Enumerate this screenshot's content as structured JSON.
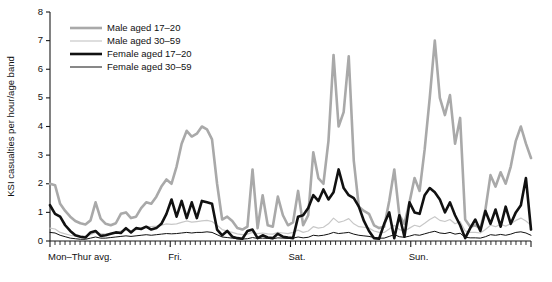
{
  "chart_data": {
    "type": "line",
    "title": "",
    "xlabel": "",
    "ylabel": "KSI casualties per hour/age band",
    "ylim": [
      0,
      8
    ],
    "xlim": [
      0,
      96
    ],
    "yticks": [
      0,
      1,
      2,
      3,
      4,
      5,
      6,
      7,
      8
    ],
    "ytick_labels": [
      "0",
      "1",
      "2",
      "3",
      "4",
      "5",
      "6",
      "7",
      "8"
    ],
    "grid": false,
    "legend_position": "top-left",
    "x_group_labels": [
      "Mon–Thur avg.",
      "Fri.",
      "Sat.",
      "Sun."
    ],
    "x_group_starts": [
      0,
      24,
      48,
      72
    ],
    "hours_per_group": 24,
    "minor_tick_interval_hours": 1,
    "series": [
      {
        "name": "Male aged 17–20",
        "color": "#a9a9a9",
        "width": 2.6,
        "values": [
          2.0,
          1.95,
          1.3,
          1.05,
          0.85,
          0.7,
          0.62,
          0.58,
          0.72,
          1.35,
          0.78,
          0.6,
          0.55,
          0.62,
          0.95,
          1.0,
          0.8,
          0.85,
          1.15,
          1.35,
          1.3,
          1.55,
          1.9,
          2.15,
          2.0,
          2.6,
          3.4,
          3.85,
          3.65,
          3.75,
          4.0,
          3.9,
          3.55,
          2.0,
          0.75,
          0.85,
          0.7,
          0.45,
          0.4,
          0.5,
          2.5,
          0.45,
          1.6,
          0.55,
          0.5,
          1.55,
          0.9,
          0.55,
          0.65,
          1.75,
          0.55,
          0.9,
          3.1,
          2.2,
          2.0,
          3.5,
          6.5,
          4.0,
          4.5,
          6.45,
          2.8,
          1.2,
          1.05,
          0.95,
          0.55,
          0.45,
          0.5,
          1.4,
          2.5,
          0.9,
          0.6,
          1.35,
          2.2,
          1.75,
          3.2,
          5.0,
          7.0,
          5.0,
          4.4,
          5.1,
          3.4,
          4.3,
          0.75,
          0.5,
          0.55,
          0.45,
          1.1,
          2.3,
          1.9,
          2.4,
          2.0,
          2.6,
          3.5,
          4.0,
          3.4,
          2.9
        ]
      },
      {
        "name": "Male aged 30–59",
        "color": "#c8c8c8",
        "width": 1.2,
        "values": [
          0.45,
          0.42,
          0.3,
          0.25,
          0.2,
          0.18,
          0.16,
          0.18,
          0.22,
          0.3,
          0.26,
          0.24,
          0.25,
          0.3,
          0.35,
          0.38,
          0.36,
          0.4,
          0.45,
          0.5,
          0.5,
          0.52,
          0.55,
          0.6,
          0.58,
          0.6,
          0.65,
          0.7,
          0.66,
          0.68,
          0.7,
          0.72,
          0.68,
          0.55,
          0.4,
          0.35,
          0.3,
          0.25,
          0.22,
          0.24,
          0.3,
          0.26,
          0.28,
          0.25,
          0.24,
          0.3,
          0.28,
          0.26,
          0.3,
          0.38,
          0.3,
          0.35,
          0.5,
          0.45,
          0.48,
          0.6,
          0.8,
          0.65,
          0.7,
          0.78,
          0.6,
          0.5,
          0.48,
          0.45,
          0.35,
          0.3,
          0.3,
          0.42,
          0.55,
          0.4,
          0.35,
          0.45,
          0.55,
          0.5,
          0.62,
          0.75,
          0.85,
          0.72,
          0.68,
          0.75,
          0.6,
          0.68,
          0.35,
          0.3,
          0.3,
          0.28,
          0.4,
          0.55,
          0.5,
          0.58,
          0.52,
          0.6,
          0.72,
          0.8,
          0.7,
          0.55
        ]
      },
      {
        "name": "Female aged 17–20",
        "color": "#111111",
        "width": 2.6,
        "values": [
          1.25,
          0.95,
          0.85,
          0.55,
          0.35,
          0.2,
          0.15,
          0.12,
          0.3,
          0.35,
          0.18,
          0.2,
          0.25,
          0.3,
          0.28,
          0.45,
          0.3,
          0.45,
          0.42,
          0.5,
          0.4,
          0.45,
          0.6,
          0.95,
          1.45,
          0.85,
          1.4,
          0.8,
          1.35,
          0.8,
          1.4,
          1.35,
          1.3,
          0.4,
          0.2,
          0.35,
          0.15,
          0.1,
          0.08,
          0.35,
          0.4,
          0.1,
          0.2,
          0.12,
          0.1,
          0.25,
          0.15,
          0.12,
          0.1,
          0.85,
          0.9,
          1.15,
          1.6,
          1.4,
          1.8,
          1.45,
          1.7,
          2.5,
          1.85,
          1.6,
          1.5,
          1.2,
          0.7,
          0.35,
          0.1,
          0.08,
          0.6,
          1.0,
          0.1,
          0.9,
          0.15,
          1.35,
          1.0,
          0.95,
          1.6,
          1.85,
          1.7,
          1.45,
          1.0,
          1.35,
          0.9,
          0.55,
          0.1,
          0.45,
          0.75,
          0.35,
          1.05,
          0.6,
          1.1,
          0.5,
          1.2,
          0.6,
          1.0,
          1.25,
          2.2,
          0.4
        ]
      },
      {
        "name": "Female aged 30–59",
        "color": "#111111",
        "width": 1.0,
        "values": [
          0.3,
          0.28,
          0.2,
          0.15,
          0.1,
          0.08,
          0.06,
          0.06,
          0.1,
          0.14,
          0.1,
          0.1,
          0.12,
          0.14,
          0.16,
          0.18,
          0.16,
          0.18,
          0.2,
          0.22,
          0.2,
          0.22,
          0.24,
          0.26,
          0.25,
          0.26,
          0.28,
          0.3,
          0.28,
          0.3,
          0.3,
          0.32,
          0.3,
          0.22,
          0.14,
          0.12,
          0.1,
          0.08,
          0.07,
          0.08,
          0.12,
          0.09,
          0.1,
          0.09,
          0.08,
          0.11,
          0.1,
          0.09,
          0.1,
          0.14,
          0.11,
          0.13,
          0.2,
          0.18,
          0.2,
          0.24,
          0.3,
          0.26,
          0.28,
          0.3,
          0.24,
          0.2,
          0.18,
          0.16,
          0.12,
          0.1,
          0.1,
          0.16,
          0.22,
          0.15,
          0.13,
          0.17,
          0.22,
          0.2,
          0.25,
          0.3,
          0.34,
          0.28,
          0.26,
          0.3,
          0.24,
          0.27,
          0.13,
          0.11,
          0.11,
          0.1,
          0.15,
          0.22,
          0.2,
          0.23,
          0.2,
          0.24,
          0.3,
          0.32,
          0.28,
          0.2
        ]
      }
    ],
    "legend": [
      {
        "label": "Male aged 17–20",
        "color": "#a9a9a9",
        "width": 2.6
      },
      {
        "label": "Male aged 30–59",
        "color": "#c8c8c8",
        "width": 1.2
      },
      {
        "label": "Female aged 17–20",
        "color": "#111111",
        "width": 2.6
      },
      {
        "label": "Female aged 30–59",
        "color": "#111111",
        "width": 1.0
      }
    ]
  }
}
